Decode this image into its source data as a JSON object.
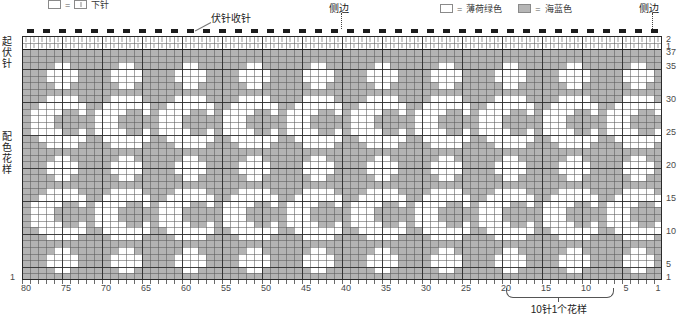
{
  "legend": {
    "knit": {
      "symbol_left": "light-square",
      "eq": "=",
      "symbol_right": "knit-symbol",
      "label": "下针"
    },
    "colors": [
      {
        "swatch": "light-square",
        "eq": "=",
        "label": "薄荷绿色",
        "hex": "#ffffff"
      },
      {
        "swatch": "dark-square",
        "eq": "=",
        "label": "海蓝色",
        "hex": "#b3b3b3"
      }
    ]
  },
  "annotations": {
    "bind_off": "伏针收针",
    "side_edge_left": "侧边",
    "side_edge_right": "侧边",
    "garter_section": "起伏针",
    "color_section": "配色花样",
    "repeat_caption": "10针1个花样"
  },
  "axes": {
    "x_label_values": [
      80,
      75,
      70,
      65,
      60,
      55,
      50,
      45,
      40,
      35,
      30,
      25,
      20,
      15,
      10,
      5,
      1
    ],
    "x_total_stitches": 80,
    "y_total_rows": 37,
    "y_right_labels": [
      {
        "value": "2",
        "row": 37
      },
      {
        "value": "1",
        "row": 36
      },
      {
        "value": "37",
        "row": 35
      },
      {
        "value": "35",
        "row": 33
      },
      {
        "value": "30",
        "row": 28
      },
      {
        "value": "25",
        "row": 23
      },
      {
        "value": "20",
        "row": 18
      },
      {
        "value": "15",
        "row": 13
      },
      {
        "value": "10",
        "row": 8
      },
      {
        "value": "5",
        "row": 3
      },
      {
        "value": "1",
        "row": 1
      }
    ],
    "y_bottom_left_label": "1"
  },
  "chart_data": {
    "type": "heatmap",
    "xlabel": "",
    "ylabel": "",
    "stitches": 80,
    "rows": 37,
    "repeat_stitches": 10,
    "repeat_caption": "10针1个花样",
    "legend": [
      "薄荷绿色",
      "海蓝色"
    ],
    "colors": {
      "0": "#ffffff",
      "1": "#b3b3b3",
      "k": "#ffffff"
    },
    "garter_rows": 2,
    "garter_row_indices": [
      36,
      37
    ],
    "note": "rows listed top(37) to bottom(1); each row is an 80-char string over stitches 80..1; 'k'=knit symbol cell, '0'=mint green, '1'=sea blue",
    "rows_top_to_bottom": [
      "kkkkkkkkkkkkkkkkkkkkkkkkkkkkkkkkkkkkkkkkkkkkkkkkkkkkkkkkkkkkkkkkkkkkkkkkkkkkkkkk",
      "kkkkkkkkkkkkkkkkkkkkkkkkkkkkkkkkkkkkkkkkkkkkkkkkkkkkkkkkkkkkkkkkkkkkkkkkkkkkkkkk",
      "11111111111111111111111111111111111111111111111111111111111111111111111111111111",
      "11111111111111111111111111111111111111111111111111111111111111111111111111111111",
      "11110011111100111111001111110011111100111111001111110011111100111111001111110011",
      "11100001111000011110000111100001111000011110000111100001111000011110000111100001",
      "11100001111000011110000111100001111000011110000111100001111000011110000111100001",
      "11110011111100111111001111110011111100111111001111110011111100111111001111110011",
      "11111111111111111111111111111111111111111111111111111111111111111111111111111111",
      "11100001111000011110000111100001111000011110000111100001111000011110000111100001",
      "11000000110000001100000011000000110000001100000011000000110000001100000011000000",
      "10000110100001101000011010000110100001101000011010000110100001101000011010000110",
      "10001111100011111000111110001111100011111000111110001111100011111000111110001111",
      "10001111100011111000111110001111100011111000111110001111100011111000111110001111",
      "10000110100001101000011010000110100001101000011010000110100001101000011010000110",
      "11000000110000001100000011000000110000001100000011000000110000001100000011000000",
      "11100001111000011110000111100001111000011110000111100001111000011110000111100001",
      "11111111111111111111111111111111111111111111111111111111111111111111111111111111",
      "11110011111100111111001111110011111100111111001111110011111100111111001111110011",
      "11100001111000011110000111100001111000011110000111100001111000011110000111100001",
      "11100001111000011110000111100001111000011110000111100001111000011110000111100001",
      "11110011111100111111001111110011111100111111001111110011111100111111001111110011",
      "11111111111111111111111111111111111111111111111111111111111111111111111111111111",
      "11100001111000011110000111100001111000011110000111100001111000011110000111100001",
      "11000000110000001100000011000000110000001100000011000000110000001100000011000000",
      "10000110100001101000011010000110100001101000011010000110100001101000011010000110",
      "10001111100011111000111110001111100011111000111110001111100011111000111110001111",
      "10001111100011111000111110001111100011111000111110001111100011111000111110001111",
      "10000110100001101000011010000110100001101000011010000110100001101000011010000110",
      "11000000110000001100000011000000110000001100000011000000110000001100000011000000",
      "11100001111000011110000111100001111000011110000111100001111000011110000111100001",
      "11111111111111111111111111111111111111111111111111111111111111111111111111111111",
      "11110011111100111111001111110011111100111111001111110011111100111111001111110011",
      "11100001111000011110000111100001111000011110000111100001111000011110000111100001",
      "11100001111000011110000111100001111000011110000111100001111000011110000111100001",
      "11110011111100111111001111110011111100111111001111110011111100111111001111110011",
      "11111111111111111111111111111111111111111111111111111111111111111111111111111111"
    ]
  }
}
